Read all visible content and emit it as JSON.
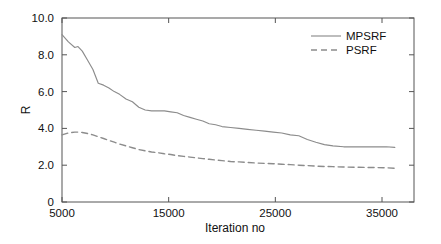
{
  "chart_data": {
    "type": "line",
    "title": "",
    "xlabel": "Iteration no",
    "ylabel": "R",
    "xlim": [
      5000,
      38000
    ],
    "ylim": [
      0,
      10
    ],
    "xticks": [
      5000,
      15000,
      25000,
      35000
    ],
    "xticklabels": [
      "5000",
      "15000",
      "25000",
      "35000"
    ],
    "yticks": [
      0,
      2,
      4,
      6,
      8,
      10
    ],
    "yticklabels": [
      "0",
      "2.0",
      "4.0",
      "6.0",
      "8.0",
      "10.0"
    ],
    "grid": false,
    "legend_position": "upper right",
    "x": [
      5000,
      5600,
      6200,
      6500,
      6900,
      7400,
      7900,
      8400,
      8900,
      9400,
      9900,
      10400,
      11000,
      11600,
      12200,
      12800,
      13400,
      14000,
      14600,
      15200,
      15800,
      16400,
      17000,
      17600,
      18200,
      18800,
      19400,
      20000,
      20800,
      21600,
      22400,
      23200,
      24000,
      24800,
      25600,
      26400,
      27200,
      28000,
      28800,
      29600,
      30400,
      31400,
      32400,
      33400,
      34400,
      35400,
      36200
    ],
    "series": [
      {
        "name": "MPSRF",
        "style": "solid",
        "color": "#8c8c8c",
        "values": [
          9.1,
          8.7,
          8.4,
          8.45,
          8.2,
          7.7,
          7.2,
          6.45,
          6.35,
          6.2,
          6.0,
          5.85,
          5.6,
          5.45,
          5.15,
          5.0,
          4.95,
          4.95,
          4.95,
          4.9,
          4.85,
          4.7,
          4.6,
          4.5,
          4.4,
          4.25,
          4.2,
          4.1,
          4.05,
          4.0,
          3.95,
          3.9,
          3.85,
          3.8,
          3.75,
          3.65,
          3.6,
          3.4,
          3.25,
          3.12,
          3.05,
          3.0,
          3.0,
          3.0,
          3.0,
          3.0,
          2.97
        ]
      },
      {
        "name": "PSRF",
        "style": "dashed",
        "color": "#8c8c8c",
        "values": [
          3.65,
          3.75,
          3.8,
          3.8,
          3.78,
          3.72,
          3.65,
          3.55,
          3.45,
          3.35,
          3.25,
          3.15,
          3.05,
          2.95,
          2.85,
          2.78,
          2.72,
          2.68,
          2.62,
          2.58,
          2.52,
          2.48,
          2.44,
          2.4,
          2.36,
          2.32,
          2.28,
          2.25,
          2.2,
          2.18,
          2.15,
          2.12,
          2.1,
          2.08,
          2.05,
          2.03,
          2.0,
          1.98,
          1.95,
          1.93,
          1.92,
          1.9,
          1.89,
          1.88,
          1.87,
          1.86,
          1.83
        ]
      }
    ]
  },
  "legend": {
    "entries": [
      {
        "label": "MPSRF"
      },
      {
        "label": "PSRF"
      }
    ]
  },
  "axes": {
    "x_title": "Iteration no",
    "y_title": "R"
  }
}
